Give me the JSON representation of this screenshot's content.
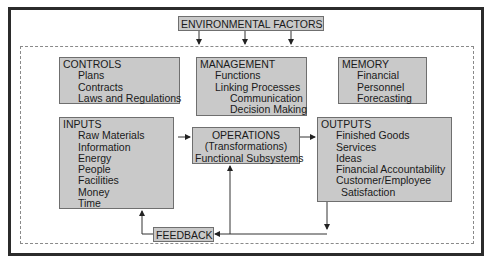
{
  "diagram": {
    "environment": {
      "label": "ENVIRONMENTAL FACTORS"
    },
    "controls": {
      "title": "CONTROLS",
      "items": [
        "Plans",
        "Contracts",
        "Laws and Regulations"
      ]
    },
    "management": {
      "title": "MANAGEMENT",
      "items": [
        "Functions",
        "Linking Processes"
      ],
      "subitems": [
        "Communication",
        "Decision Making"
      ]
    },
    "memory": {
      "title": "MEMORY",
      "items": [
        "Financial",
        "Personnel",
        "Forecasting"
      ]
    },
    "inputs": {
      "title": "INPUTS",
      "items": [
        "Raw Materials",
        "Information",
        "Energy",
        "People",
        "Facilities",
        "Money",
        "Time"
      ]
    },
    "operations": {
      "lines": [
        "OPERATIONS",
        "(Transformations)",
        "Functional Subsystems"
      ]
    },
    "outputs": {
      "title": "OUTPUTS",
      "items": [
        "Finished Goods",
        "Services",
        "Ideas",
        "Financial Accountability",
        "Customer/Employee"
      ],
      "continuation": "Satisfaction"
    },
    "feedback": {
      "label": "FEEDBACK"
    },
    "colors": {
      "box_fill": "#c9c9c9",
      "box_border": "#6f6f6f",
      "frame": "#2b2b2b",
      "dashed": "#8a8a8a",
      "line": "#333333"
    }
  }
}
